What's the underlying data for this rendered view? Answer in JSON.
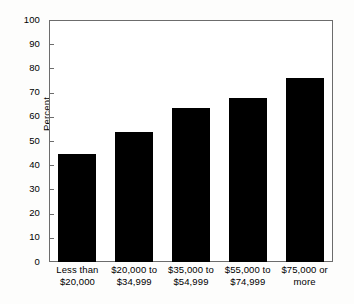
{
  "chart_data": {
    "type": "bar",
    "title": "",
    "subtitle": "",
    "xlabel": "",
    "ylabel": "Percent",
    "ylim": [
      0,
      100
    ],
    "yticks": [
      0,
      10,
      20,
      30,
      40,
      50,
      60,
      70,
      80,
      90,
      100
    ],
    "ytick_labels": [
      "0",
      "10",
      "20",
      "30",
      "40",
      "50",
      "60",
      "70",
      "80",
      "90",
      "100"
    ],
    "grid": false,
    "legend": false,
    "legend_position": "none",
    "bar_color": "#000000",
    "frame_color": "#6c6c6c",
    "background_color": "#ffffff",
    "categories": [
      "Less than $20,000",
      "$20,000 to $34,999",
      "$35,000 to $54,999",
      "$55,000 to $74,999",
      "$75,000 or more"
    ],
    "category_lines": [
      [
        "Less than",
        "$20,000"
      ],
      [
        "$20,000 to",
        "$34,999"
      ],
      [
        "$35,000 to",
        "$54,999"
      ],
      [
        "$55,000 to",
        "$74,999"
      ],
      [
        "$75,000 or",
        "more"
      ]
    ],
    "values": [
      44.6,
      53.7,
      63.6,
      67.8,
      76.0
    ]
  }
}
